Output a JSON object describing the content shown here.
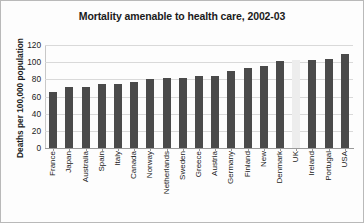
{
  "chart_data": {
    "type": "bar",
    "title": "Mortality amenable to health care, 2002-03",
    "xlabel": "",
    "ylabel": "Deaths per 100,000 population",
    "ylim": [
      0,
      120
    ],
    "yticks": [
      0,
      20,
      40,
      60,
      80,
      100,
      120
    ],
    "ytick_labels": [
      "0",
      "20",
      "40",
      "60",
      "80",
      "100",
      "120"
    ],
    "grid": true,
    "legend": "none",
    "bar_color": "#4a4a4a",
    "highlight_color": "#ededed",
    "highlight_category": "UK",
    "categories": [
      "France",
      "Japan",
      "Australia",
      "Spain",
      "Italy",
      "Canada",
      "Norway",
      "Netherlands",
      "Sweden",
      "Greece",
      "Austria",
      "Germany",
      "Finland",
      "New",
      "Denmark",
      "UK",
      "Ireland",
      "Portugal",
      "USA"
    ],
    "values": [
      65,
      71,
      71,
      74,
      74,
      77,
      80,
      82,
      82,
      84,
      84,
      90,
      93,
      96,
      101,
      103,
      103,
      104,
      110
    ]
  }
}
